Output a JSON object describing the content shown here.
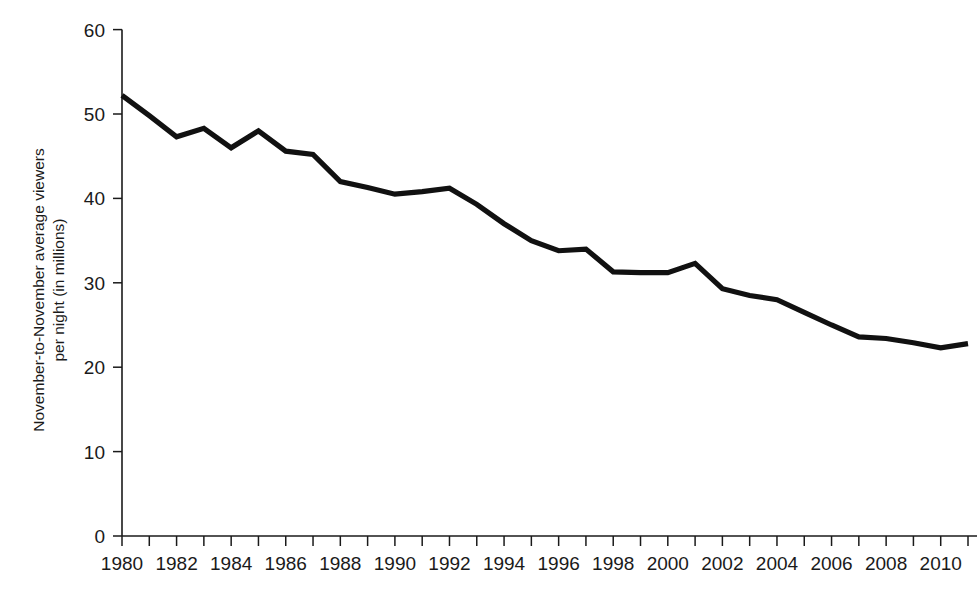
{
  "chart_data": {
    "type": "line",
    "title": "",
    "subtitle": "",
    "xlabel": "",
    "ylabel": "November-to-November average viewers per night  (in millions)",
    "ylabel_line1": "November-to-November average viewers",
    "ylabel_line2": "per night  (in millions)",
    "xlim": [
      1980,
      2011
    ],
    "ylim": [
      0,
      60
    ],
    "grid": false,
    "legend": null,
    "y_ticks": [
      0,
      10,
      20,
      30,
      40,
      50,
      60
    ],
    "y_tick_labels": [
      "0",
      "10",
      "20",
      "30",
      "40",
      "50",
      "60"
    ],
    "x_ticks": [
      1980,
      1981,
      1982,
      1983,
      1984,
      1985,
      1986,
      1987,
      1988,
      1989,
      1990,
      1991,
      1992,
      1993,
      1994,
      1995,
      1996,
      1997,
      1998,
      1999,
      2000,
      2001,
      2002,
      2003,
      2004,
      2005,
      2006,
      2007,
      2008,
      2009,
      2010,
      2011
    ],
    "x_tick_labels": [
      "1980",
      "",
      "1982",
      "",
      "1984",
      "",
      "1986",
      "",
      "1988",
      "",
      "1990",
      "",
      "1992",
      "",
      "1994",
      "",
      "1996",
      "",
      "1998",
      "",
      "2000",
      "",
      "2002",
      "",
      "2004",
      "",
      "2006",
      "",
      "2008",
      "",
      "2010",
      ""
    ],
    "x": [
      1980,
      1981,
      1982,
      1983,
      1984,
      1985,
      1986,
      1987,
      1988,
      1989,
      1990,
      1991,
      1992,
      1993,
      1994,
      1995,
      1996,
      1997,
      1998,
      1999,
      2000,
      2001,
      2002,
      2003,
      2004,
      2005,
      2006,
      2007,
      2008,
      2009,
      2010,
      2011
    ],
    "values": [
      52.2,
      49.8,
      47.3,
      48.3,
      46.0,
      48.0,
      45.6,
      45.2,
      42.0,
      41.3,
      40.5,
      40.8,
      41.2,
      39.3,
      37.0,
      35.0,
      33.8,
      34.0,
      31.3,
      31.2,
      31.2,
      32.3,
      29.3,
      28.5,
      28.0,
      26.5,
      25.0,
      23.6,
      23.4,
      22.9,
      22.3,
      22.8
    ],
    "line_color": "#111111",
    "axis_color": "#1a1a1a",
    "background_color": "#ffffff",
    "series_name": "November-to-November average viewers per night (in millions)"
  }
}
